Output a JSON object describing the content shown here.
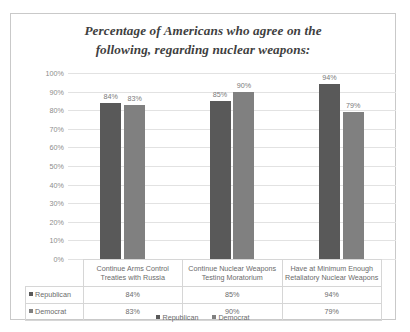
{
  "chart_data": {
    "type": "bar",
    "title": "Percentage of Americans who agree on the following, regarding nuclear weapons:",
    "title_line1": "Percentage of Americans who agree on the",
    "title_line2": "following, regarding nuclear weapons:",
    "xlabel": "",
    "ylabel": "",
    "ylim": [
      0,
      100
    ],
    "ytick_labels": [
      "100%",
      "90%",
      "80%",
      "70%",
      "60%",
      "50%",
      "40%",
      "30%",
      "20%",
      "10%",
      "0%"
    ],
    "ytick_values": [
      100,
      90,
      80,
      70,
      60,
      50,
      40,
      30,
      20,
      10,
      0
    ],
    "grid": true,
    "legend_position": "bottom",
    "categories": [
      "Continue Arms Control Treaties with Russia",
      "Continue Nuclear Weapons Testing Moratorium",
      "Have at Minimum Enough Retaliatory Nuclear Weapons"
    ],
    "category_lines": [
      [
        "Continue Arms Control",
        "Treaties with Russia"
      ],
      [
        "Continue Nuclear Weapons",
        "Testing Moratorium"
      ],
      [
        "Have at Minimum Enough",
        "Retaliatory Nuclear Weapons"
      ]
    ],
    "series": [
      {
        "name": "Republican",
        "color": "#595959",
        "values": [
          84,
          85,
          94
        ],
        "value_labels": [
          "84%",
          "85%",
          "94%"
        ]
      },
      {
        "name": "Democrat",
        "color": "#808080",
        "values": [
          83,
          90,
          79
        ],
        "value_labels": [
          "83%",
          "90%",
          "79%"
        ]
      }
    ]
  },
  "table": {
    "row_labels": [
      "Republican",
      "Democrat"
    ],
    "rows": [
      {
        "label": "Republican",
        "values": [
          "84%",
          "85%",
          "94%"
        ]
      },
      {
        "label": "Democrat",
        "values": [
          "83%",
          "90%",
          "79%"
        ]
      }
    ]
  },
  "legend": {
    "items": [
      {
        "label": "Republican",
        "color": "#595959"
      },
      {
        "label": "Democrat",
        "color": "#808080"
      }
    ]
  },
  "colors": {
    "republican": "#595959",
    "democrat": "#808080",
    "gridline": "#e2e2e2",
    "frame": "#c9c9c9",
    "text": "#6b6b6b",
    "title": "#3f3f3f"
  }
}
